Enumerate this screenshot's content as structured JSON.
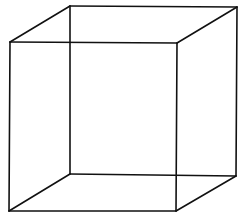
{
  "diagram": {
    "type": "wireframe-cube",
    "stroke_color": "#111111",
    "background": "#ffffff",
    "vertices": {
      "front_tl": [
        10,
        42
      ],
      "front_tr": [
        177,
        43
      ],
      "front_br": [
        176,
        211
      ],
      "front_bl": [
        9,
        211
      ],
      "back_tl": [
        70,
        6
      ],
      "back_tr": [
        237,
        7
      ],
      "back_br": [
        236,
        176
      ],
      "back_bl": [
        70,
        174
      ]
    },
    "edges": [
      [
        "front_tl",
        "front_tr"
      ],
      [
        "front_tr",
        "front_br"
      ],
      [
        "front_br",
        "front_bl"
      ],
      [
        "front_bl",
        "front_tl"
      ],
      [
        "back_tl",
        "back_tr"
      ],
      [
        "back_tr",
        "back_br"
      ],
      [
        "back_br",
        "back_bl"
      ],
      [
        "back_bl",
        "back_tl"
      ],
      [
        "front_tl",
        "back_tl"
      ],
      [
        "front_tr",
        "back_tr"
      ],
      [
        "front_br",
        "back_br"
      ],
      [
        "front_bl",
        "back_bl"
      ]
    ]
  }
}
